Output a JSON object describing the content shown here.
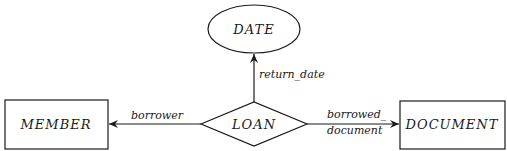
{
  "diagram": {
    "type": "entity-relationship",
    "colors": {
      "stroke": "#1a1a1a",
      "background": "#ffffff"
    },
    "entities": [
      {
        "id": "member",
        "label": "MEMBER",
        "shape": "rectangle"
      },
      {
        "id": "document",
        "label": "DOCUMENT",
        "shape": "rectangle"
      },
      {
        "id": "date",
        "label": "DATE",
        "shape": "ellipse"
      }
    ],
    "relationship": {
      "id": "loan",
      "label": "LOAN",
      "shape": "diamond"
    },
    "edges": [
      {
        "from": "loan",
        "to": "member",
        "label": "borrower"
      },
      {
        "from": "loan",
        "to": "document",
        "label_line1": "borrowed_",
        "label_line2": "document"
      },
      {
        "from": "loan",
        "to": "date",
        "label": "return_date"
      }
    ]
  }
}
